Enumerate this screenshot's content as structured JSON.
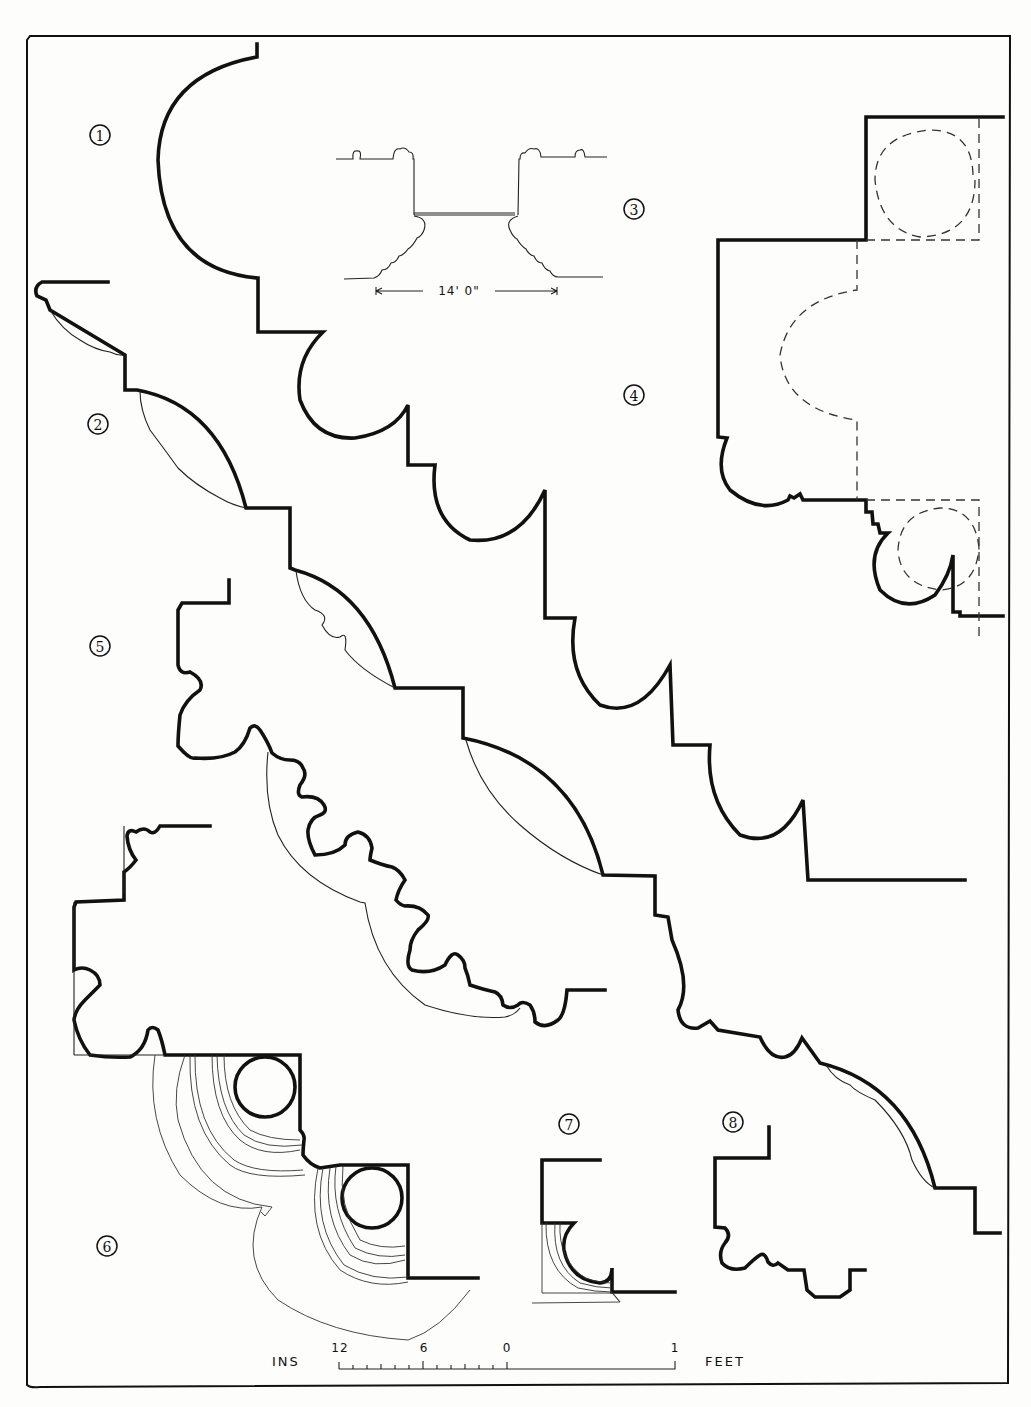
{
  "plate": {
    "background": "#fdfdfb",
    "ink": "#111111"
  },
  "figures": [
    {
      "number": "1",
      "label": "Profile 1 — large torus with cavetto"
    },
    {
      "number": "2",
      "label": "Profile 2 — cyma with enrichment"
    },
    {
      "number": "3",
      "label": "Profile 3 — section through opening"
    },
    {
      "number": "4",
      "label": "Profile 4 — with dashed construction circles"
    },
    {
      "number": "5",
      "label": "Profile 5 — carved enriched molding"
    },
    {
      "number": "6",
      "label": "Profile 6 — base with concentric rings"
    },
    {
      "number": "7",
      "label": "Profile 7 — small cavetto"
    },
    {
      "number": "8",
      "label": "Profile 8 — small stepped molding"
    }
  ],
  "dimension": {
    "text": "14' 0\""
  },
  "scale_bar": {
    "left_label": "INS",
    "right_label": "FEET",
    "ticks": [
      "12",
      "6",
      "0",
      "1"
    ]
  }
}
